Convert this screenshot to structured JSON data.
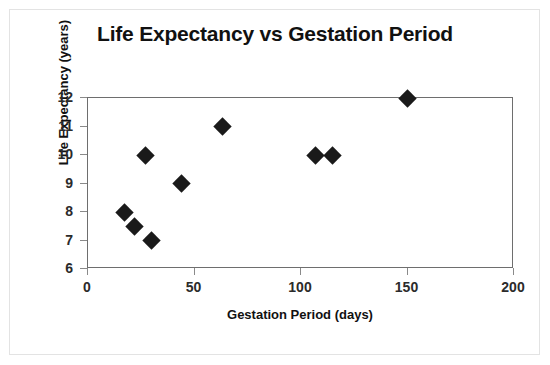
{
  "chart_data": {
    "type": "scatter",
    "title": "Life Expectancy vs Gestation Period",
    "xlabel": "Gestation Period (days)",
    "ylabel": "Life Expectancy (years)",
    "xlim": [
      0,
      200
    ],
    "ylim": [
      6,
      12
    ],
    "xticks": [
      0,
      50,
      100,
      150,
      200
    ],
    "yticks": [
      6,
      7,
      8,
      9,
      10,
      11,
      12
    ],
    "xtick_labels": [
      "0",
      "50",
      "100",
      "150",
      "200"
    ],
    "ytick_labels": [
      "6",
      "7",
      "8",
      "9",
      "10",
      "11",
      "12"
    ],
    "grid": false,
    "legend": false,
    "marker": "diamond",
    "marker_color": "#1a1a1a",
    "plot_border_color": "#6e6e6e",
    "background_color": "#ffffff",
    "series": [
      {
        "name": "Animals",
        "points": [
          {
            "x": 17,
            "y": 8.0
          },
          {
            "x": 22,
            "y": 7.5
          },
          {
            "x": 27,
            "y": 10.0
          },
          {
            "x": 30,
            "y": 7.0
          },
          {
            "x": 44,
            "y": 9.0
          },
          {
            "x": 63,
            "y": 11.0
          },
          {
            "x": 107,
            "y": 10.0
          },
          {
            "x": 115,
            "y": 10.0
          },
          {
            "x": 150,
            "y": 12.0
          }
        ]
      }
    ]
  }
}
